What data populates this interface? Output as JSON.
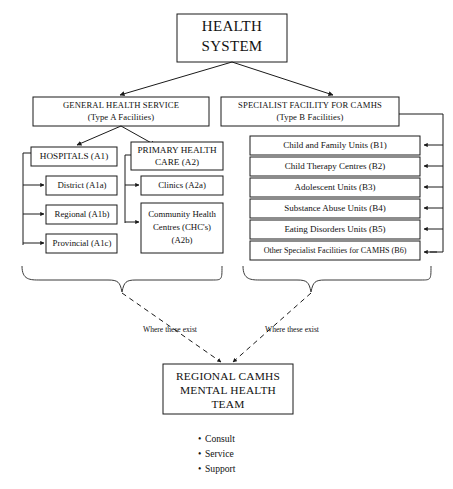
{
  "diagram": {
    "colors": {
      "background": "#ffffff",
      "stroke": "#1a1a1a",
      "text": "#111111",
      "brace": "#3a3a3a"
    },
    "root": {
      "label_line1": "HEALTH",
      "label_line2": "SYSTEM"
    },
    "branches": [
      {
        "id": "type-a",
        "label_line1": "GENERAL HEALTH SERVICE",
        "label_line2": "(Type A Facilities)"
      },
      {
        "id": "type-b",
        "label_line1": "SPECIALIST FACILITY FOR CAMHS",
        "label_line2": "(Type B Facilities)"
      }
    ],
    "type_a_groups": [
      {
        "id": "hospitals",
        "label_line1": "HOSPITALS (A1)",
        "label_line2": "",
        "children": [
          {
            "label": "District (A1a)"
          },
          {
            "label": "Regional (A1b)"
          },
          {
            "label": "Provincial (A1c)"
          }
        ]
      },
      {
        "id": "primary-health-care",
        "label_line1": "PRIMARY HEALTH",
        "label_line2": "CARE (A2)",
        "children": [
          {
            "label_line1": "Clinics (A2a)",
            "label_line2": "",
            "label_line3": ""
          },
          {
            "label_line1": "Community Health",
            "label_line2": "Centres (CHC's)",
            "label_line3": "(A2b)"
          }
        ]
      }
    ],
    "type_b_units": [
      {
        "label": "Child and Family Units (B1)"
      },
      {
        "label": "Child Therapy Centres (B2)"
      },
      {
        "label": "Adolescent Units (B3)"
      },
      {
        "label": "Substance Abuse Units (B4)"
      },
      {
        "label": "Eating Disorders Units (B5)"
      },
      {
        "label": "Other Specialist Facilities for CAMHS (B6)"
      }
    ],
    "edge_labels": [
      {
        "id": "left",
        "text": "Where these exist"
      },
      {
        "id": "right",
        "text": "Where these exist"
      }
    ],
    "final_node": {
      "label_line1": "REGIONAL CAMHS",
      "label_line2": "MENTAL HEALTH",
      "label_line3": "TEAM"
    },
    "functions": [
      {
        "bullet": "•",
        "label": "Consult"
      },
      {
        "bullet": "•",
        "label": "Service"
      },
      {
        "bullet": "•",
        "label": "Support"
      }
    ]
  }
}
